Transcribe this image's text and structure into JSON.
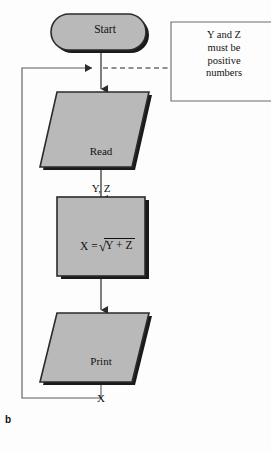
{
  "figure": {
    "panel_letter": "b",
    "colors": {
      "background": "#fdfdfd",
      "shape_fill": "#b9b9b9",
      "shape_stroke": "#2b2b2b",
      "shadow": "#1a1a1a",
      "connector": "#5a5a5a",
      "annotation_stroke": "#6b6b6b",
      "text": "#111111"
    }
  },
  "nodes": {
    "start": {
      "shape": "terminator",
      "label": "Start"
    },
    "read": {
      "shape": "parallelogram",
      "label_line1": "Read",
      "label_line2": "Y, Z"
    },
    "process": {
      "shape": "rectangle",
      "lhs": "X =",
      "radical_sign": "√",
      "radicand": "Y + Z"
    },
    "print": {
      "shape": "parallelogram",
      "label_line1": "Print",
      "label_line2": "X"
    }
  },
  "annotation": {
    "shape": "comment-box",
    "lines": [
      "Y and Z",
      "must be",
      "positive",
      "numbers"
    ]
  },
  "connectors": [
    {
      "name": "start-to-read",
      "style": "solid",
      "arrow": "down"
    },
    {
      "name": "read-to-process",
      "style": "solid",
      "arrow": "down"
    },
    {
      "name": "process-to-print",
      "style": "solid",
      "arrow": "down"
    },
    {
      "name": "print-loop-back",
      "style": "solid",
      "arrow": "right"
    },
    {
      "name": "annotation-link",
      "style": "dashed",
      "arrow": "none"
    }
  ]
}
